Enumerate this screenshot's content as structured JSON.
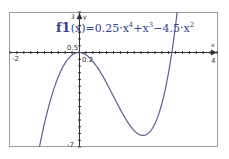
{
  "chart_data": {
    "type": "line",
    "title": "",
    "function_label": "f1(x)=0.25·x^4+x^3−4.5·x^2",
    "series": [
      {
        "name": "f1(x)",
        "expression": "0.25*x^4 + x^3 - 4.5*x^2",
        "color": "#5a5f8f",
        "x": [
          -2,
          -1.5,
          -1,
          -0.5,
          0,
          0.5,
          1,
          1.5,
          1.854,
          2,
          2.5,
          2.69,
          3
        ],
        "y": [
          -14,
          -9.48,
          -3.25,
          -0.61,
          0,
          -1,
          -3.25,
          -5.48,
          -6.14,
          -6,
          -2.83,
          0,
          6.75
        ]
      }
    ],
    "xlabel": "x",
    "ylabel": "y",
    "xlim": [
      -2,
      4
    ],
    "ylim": [
      -7,
      3
    ],
    "x_tick_labels": [
      "-2",
      "0.2",
      "4"
    ],
    "y_tick_labels": [
      "3",
      "0.5",
      "-7"
    ],
    "grid": false,
    "legend": "none"
  },
  "labels": {
    "fname": "f1",
    "formula_part1": "(x)=0.25·x",
    "exp4": "4",
    "formula_part2": "+x",
    "exp3": "3",
    "formula_part3": "−4.5·x",
    "exp2": "2",
    "x_min": "-2",
    "x_max": "4",
    "x_tick": "0.2",
    "y_max": "3",
    "y_tick": "0.5",
    "y_min": "-7",
    "x_axis": "x",
    "y_axis": "y"
  }
}
